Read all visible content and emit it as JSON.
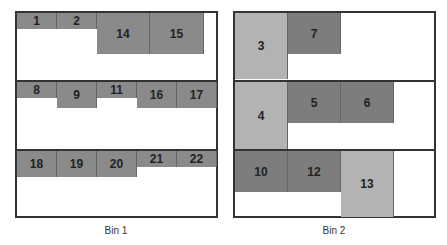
{
  "bins": [
    {
      "label": "Bin 1",
      "rows": [
        {
          "items": [
            {
              "id": "1",
              "x": 0,
              "w": 40,
              "h": 16,
              "shade": "dark"
            },
            {
              "id": "2",
              "x": 40,
              "w": 40,
              "h": 16,
              "shade": "dark"
            },
            {
              "id": "14",
              "x": 80,
              "w": 53,
              "h": 41,
              "shade": "dark"
            },
            {
              "id": "15",
              "x": 133,
              "w": 54,
              "h": 41,
              "shade": "dark"
            }
          ]
        },
        {
          "items": [
            {
              "id": "8",
              "x": 0,
              "w": 40,
              "h": 16,
              "shade": "dark"
            },
            {
              "id": "9",
              "x": 40,
              "w": 40,
              "h": 26,
              "shade": "dark"
            },
            {
              "id": "11",
              "x": 80,
              "w": 40,
              "h": 16,
              "shade": "dark"
            },
            {
              "id": "16",
              "x": 120,
              "w": 40,
              "h": 26,
              "shade": "dark"
            },
            {
              "id": "17",
              "x": 160,
              "w": 40,
              "h": 26,
              "shade": "dark"
            }
          ]
        },
        {
          "items": [
            {
              "id": "18",
              "x": 0,
              "w": 40,
              "h": 26,
              "shade": "dark"
            },
            {
              "id": "19",
              "x": 40,
              "w": 40,
              "h": 26,
              "shade": "dark"
            },
            {
              "id": "20",
              "x": 80,
              "w": 40,
              "h": 26,
              "shade": "dark"
            },
            {
              "id": "21",
              "x": 120,
              "w": 40,
              "h": 16,
              "shade": "dark"
            },
            {
              "id": "22",
              "x": 160,
              "w": 40,
              "h": 16,
              "shade": "dark"
            }
          ]
        }
      ]
    },
    {
      "label": "Bin 2",
      "rows": [
        {
          "items": [
            {
              "id": "3",
              "x": 0,
              "w": 53,
              "h": 66,
              "shade": "light"
            },
            {
              "id": "7",
              "x": 53,
              "w": 53,
              "h": 41,
              "shade": "darker"
            }
          ]
        },
        {
          "items": [
            {
              "id": "4",
              "x": 0,
              "w": 53,
              "h": 67,
              "shade": "light"
            },
            {
              "id": "5",
              "x": 53,
              "w": 53,
              "h": 41,
              "shade": "darker"
            },
            {
              "id": "6",
              "x": 106,
              "w": 53,
              "h": 41,
              "shade": "darker"
            }
          ]
        },
        {
          "items": [
            {
              "id": "10",
              "x": 0,
              "w": 53,
              "h": 41,
              "shade": "darker"
            },
            {
              "id": "12",
              "x": 53,
              "w": 53,
              "h": 41,
              "shade": "darker"
            },
            {
              "id": "13",
              "x": 106,
              "w": 53,
              "h": 66,
              "shade": "light"
            }
          ]
        }
      ]
    }
  ],
  "colors": {
    "dark": "#8a8a8a",
    "darker": "#7d7d7d",
    "light": "#b3b3b3",
    "border": "#333333"
  }
}
